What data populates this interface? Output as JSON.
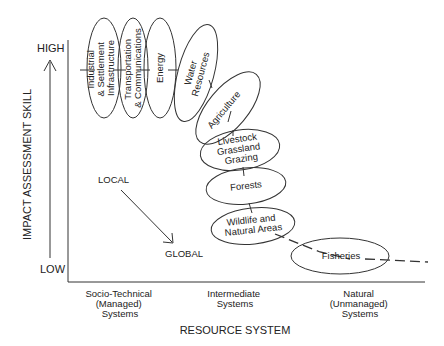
{
  "y_axis": {
    "title": "IMPACT ASSESSMENT SKILL",
    "high_label": "HIGH",
    "low_label": "LOW"
  },
  "x_axis": {
    "title": "RESOURCE SYSTEM",
    "categories": [
      [
        "Socio-Technical",
        "(Managed)",
        "Systems"
      ],
      [
        "Intermediate",
        "Systems"
      ],
      [
        "Natural",
        "(Unmanaged)",
        "Systems"
      ]
    ]
  },
  "scale_arrow": {
    "from": "LOCAL",
    "to": "GLOBAL"
  },
  "sectors": [
    {
      "lines": [
        "Industrial",
        "& Settlement",
        "Infrastructure"
      ]
    },
    {
      "lines": [
        "Transportation",
        "& Communications"
      ]
    },
    {
      "lines": [
        "Energy"
      ]
    },
    {
      "lines": [
        "Water",
        "Resources"
      ]
    },
    {
      "lines": [
        "Agriculture"
      ]
    },
    {
      "lines": [
        "Livestock",
        "Grassland",
        "Grazing"
      ]
    },
    {
      "lines": [
        "Forests"
      ]
    },
    {
      "lines": [
        "Wildlife and",
        "Natural Areas"
      ]
    },
    {
      "lines": [
        "Fisheries"
      ]
    }
  ],
  "colors": {
    "ink": "#222222",
    "background": "#ffffff"
  }
}
